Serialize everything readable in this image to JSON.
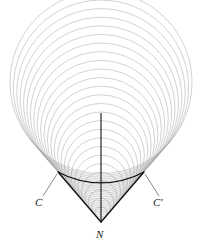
{
  "figure": {
    "background_color": "#ffffff",
    "width": 202,
    "height": 244,
    "circle_family": {
      "description": "Nested circles with centers on the vertical axis, all tangent to the caustic cone",
      "count": 26,
      "stroke_color": "#9a9a9a",
      "stroke_width": 0.45,
      "center_x": 101,
      "cusp_x": 101,
      "cusp_y": 222,
      "radius_min": 6,
      "radius_max": 91,
      "radii": [
        6,
        9.4,
        12.8,
        16.2,
        19.6,
        23,
        26.4,
        29.8,
        33.2,
        36.6,
        40,
        43.4,
        46.8,
        50.2,
        53.6,
        57,
        60.4,
        63.8,
        67.2,
        70.6,
        74,
        77.4,
        80.8,
        84.2,
        87.6,
        91
      ]
    },
    "axis": {
      "name": "vertical-axis",
      "x": 101,
      "y_top": 113,
      "y_bottom": 222,
      "stroke_color": "#111111",
      "stroke_width": 1.1
    },
    "caustic": {
      "name": "caustic-cone",
      "stroke_color": "#111111",
      "stroke_width": 1.3,
      "left_point_x": 58,
      "left_point_y": 172,
      "right_point_x": 144,
      "right_point_y": 172,
      "vertex_x": 101,
      "vertex_y": 222
    },
    "leaders": [
      {
        "name": "leader-line-C",
        "x1": 57,
        "y1": 174,
        "x2": 43,
        "y2": 196
      },
      {
        "name": "leader-line-Cp",
        "x1": 145,
        "y1": 174,
        "x2": 159,
        "y2": 196
      }
    ],
    "labels": {
      "left_cusp": "C",
      "right_cusp": "C′",
      "vertex": "N"
    },
    "colors": {
      "circles": "#9a9a9a",
      "caustic": "#111111",
      "axis": "#111111",
      "label": "#1a1a1a",
      "leader": "#555555"
    }
  }
}
